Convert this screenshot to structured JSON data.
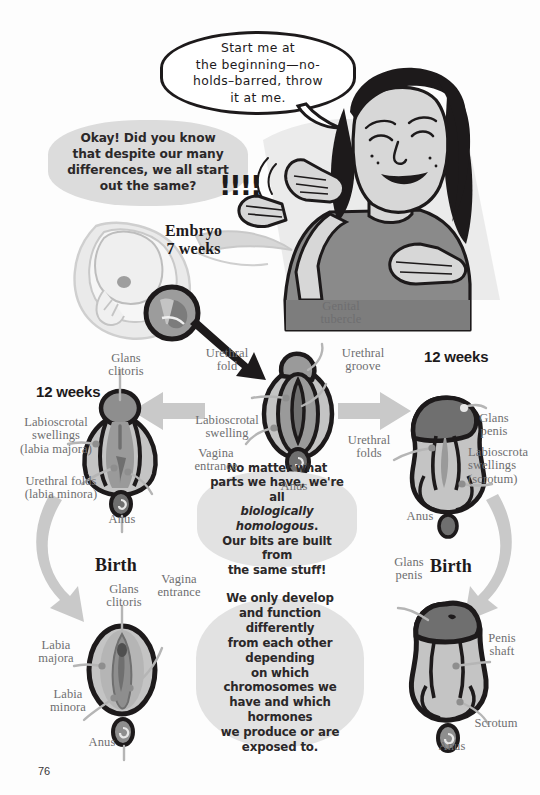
{
  "page": {
    "number": "76"
  },
  "speech": {
    "character_bubble": "Start me at\nthe beginning—no-\nholds–barred, throw\nit at me.",
    "narrator_bubble": "Okay! Did you know\nthat despite our many\ndifferences, we all start\nout the same?",
    "exclamations": "!!!!"
  },
  "info_boxes": {
    "homologous": {
      "line1": "No matter what",
      "line2": "parts we have, we're all",
      "emphasis": "biologically homologous",
      "emphasis_tail": ".",
      "line4": "Our bits are built from",
      "line5": "the same stuff!"
    },
    "develop": "We only develop\nand function differently\nfrom each other depending\non which chromosomes we\nhave and which hormones\nwe produce or are\nexposed to."
  },
  "embryo": {
    "stage_label": "Embryo\n7 weeks"
  },
  "undifferentiated": {
    "labels": {
      "genital_tubercle": "Genital\ntubercle",
      "urethral_fold": "Urethral\nfold",
      "urethral_groove": "Urethral\ngroove",
      "labioscrotal_swelling": "Labioscrotal\nswelling",
      "vagina_entrance": "Vagina\nentrance",
      "anus": "Anus"
    }
  },
  "female_12weeks": {
    "stage_label": "12 weeks",
    "labels": {
      "glans_clitoris": "Glans\nclitoris",
      "labioscrotal_swellings": "Labioscrotal\nswellings\n(labia majora)",
      "urethral_folds": "Urethral folds\n(labia minora)",
      "anus": "Anus"
    }
  },
  "male_12weeks": {
    "stage_label": "12 weeks",
    "labels": {
      "glans_penis": "Glans\npenis",
      "urethral_folds": "Urethral\nfolds",
      "labioscrotal_swellings": "Labioscrota\nswellings\n(scrotum)",
      "anus": "Anus"
    }
  },
  "female_birth": {
    "stage_label": "Birth",
    "labels": {
      "glans_clitoris": "Glans\nclitoris",
      "vagina_entrance": "Vagina\nentrance",
      "labia_majora": "Labia\nmajora",
      "labia_minora": "Labia\nminora",
      "anus": "Anus"
    }
  },
  "male_birth": {
    "stage_label": "Birth",
    "labels": {
      "glans_penis": "Glans\npenis",
      "penis_shaft": "Penis\nshaft",
      "scrotum": "Scrotum",
      "anus": "Anus"
    }
  },
  "colors": {
    "ink": "#1d1a1b",
    "label_gray": "#6e6e70",
    "blob_gray": "#e2e2e2",
    "bubble_gray": "#dcdcdc",
    "arrow_gray": "#c9c9c9",
    "tissue_light": "#c4c4c4",
    "tissue_mid": "#9a9a9a",
    "tissue_dark": "#6f6f6f",
    "skin": "#d7d7d7",
    "hair": "#1d1a1b",
    "shirt": "#8a8a8a"
  }
}
